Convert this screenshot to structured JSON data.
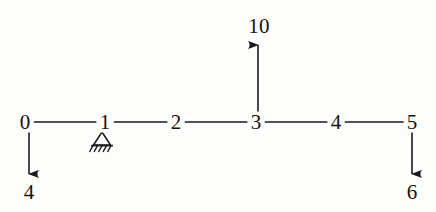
{
  "diagram": {
    "type": "structural-beam-line-diagram",
    "stroke_color": "#1a1a1a",
    "background_color": "#fdfdfc",
    "beam": {
      "y": 122,
      "x_start": 25,
      "x_end": 412
    },
    "nodes": [
      {
        "label": "0",
        "x": 25,
        "y": 122
      },
      {
        "label": "1",
        "x": 105,
        "y": 122
      },
      {
        "label": "2",
        "x": 176,
        "y": 122
      },
      {
        "label": "3",
        "x": 256,
        "y": 122
      },
      {
        "label": "4",
        "x": 336,
        "y": 122
      },
      {
        "label": "5",
        "x": 412,
        "y": 122
      }
    ],
    "supports": [
      {
        "kind": "pin-support-icon",
        "at_node": "1",
        "x": 102,
        "y": 130,
        "half_width": 9,
        "height": 12,
        "hatch_count": 5
      }
    ],
    "loads": [
      {
        "label": "4",
        "at_node": "0",
        "direction": "down",
        "x": 29,
        "y_start": 132,
        "y_end": 174,
        "label_x": 29,
        "label_y": 192
      },
      {
        "label": "10",
        "at_node": "3",
        "direction": "up",
        "x": 258,
        "y_start": 116,
        "y_end": 45,
        "label_x": 259,
        "label_y": 26
      },
      {
        "label": "6",
        "at_node": "5",
        "direction": "down",
        "x": 412,
        "y_start": 132,
        "y_end": 174,
        "label_x": 412,
        "label_y": 192
      }
    ]
  }
}
